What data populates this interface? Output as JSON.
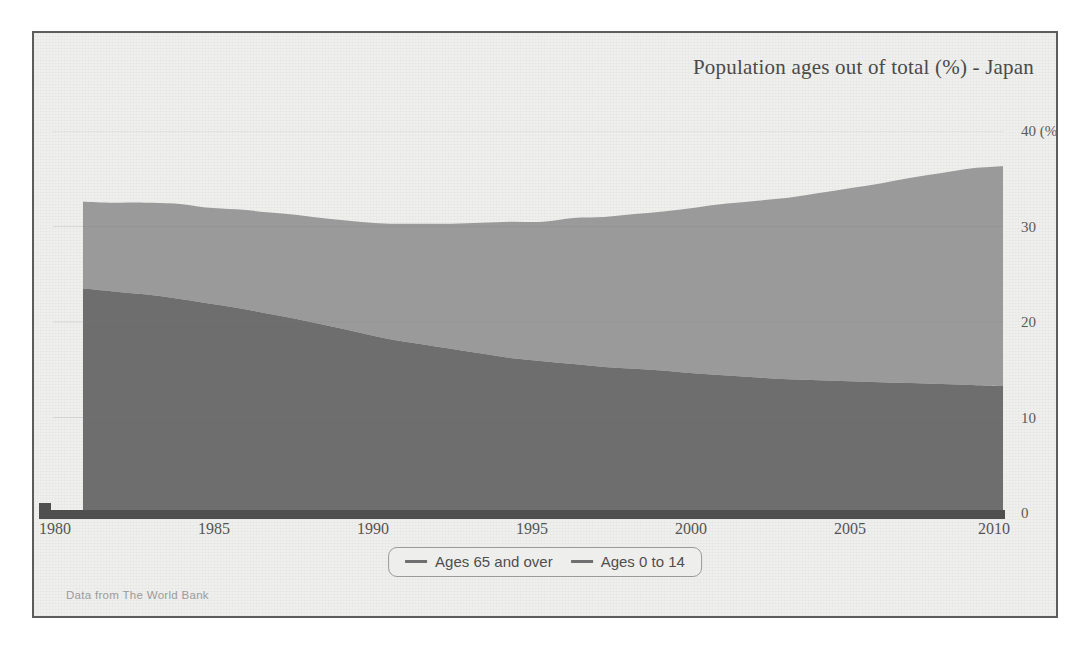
{
  "chart_data": {
    "type": "area",
    "title": "Population ages out of total (%) - Japan",
    "subtitle": "",
    "xlabel": "",
    "ylabel": "",
    "yunit": "(%)",
    "stacked": true,
    "grid": false,
    "legend_position": "bottom",
    "xlim": [
      1980,
      2010
    ],
    "ylim": [
      0,
      40
    ],
    "xticks": [
      "1980",
      "1985",
      "1990",
      "1995",
      "2000",
      "2005",
      "2010"
    ],
    "xtick_values": [
      1980,
      1985,
      1990,
      1995,
      2000,
      2005,
      2010
    ],
    "yticks": [
      "0",
      "10",
      "20",
      "30",
      "40 (%)"
    ],
    "ytick_values": [
      0,
      10,
      20,
      30,
      40
    ],
    "x": [
      1980,
      1981,
      1982,
      1983,
      1984,
      1985,
      1986,
      1987,
      1988,
      1989,
      1990,
      1991,
      1992,
      1993,
      1994,
      1995,
      1996,
      1997,
      1998,
      1999,
      2000,
      2001,
      2002,
      2003,
      2004,
      2005,
      2006,
      2007,
      2008,
      2009,
      2010
    ],
    "series": [
      {
        "name": "Ages 0 to 14",
        "color": "#6e6e6e",
        "stack_order": 1,
        "values": [
          23.5,
          23.2,
          22.9,
          22.5,
          22.0,
          21.5,
          20.9,
          20.3,
          19.6,
          18.9,
          18.2,
          17.7,
          17.2,
          16.7,
          16.2,
          15.9,
          15.6,
          15.3,
          15.1,
          14.9,
          14.6,
          14.4,
          14.2,
          14.0,
          13.9,
          13.8,
          13.7,
          13.6,
          13.5,
          13.4,
          13.3
        ]
      },
      {
        "name": "Ages 65 and over",
        "color": "#9a9a9a",
        "stack_order": 2,
        "values": [
          9.1,
          9.3,
          9.6,
          9.9,
          10.0,
          10.3,
          10.6,
          10.9,
          11.2,
          11.6,
          12.1,
          12.6,
          13.1,
          13.7,
          14.3,
          14.6,
          15.3,
          15.7,
          16.2,
          16.7,
          17.4,
          18.0,
          18.5,
          19.0,
          19.6,
          20.2,
          20.8,
          21.5,
          22.1,
          22.7,
          23.0
        ]
      }
    ],
    "totals": [
      32.6,
      32.5,
      32.5,
      32.4,
      32.0,
      31.8,
      31.5,
      31.2,
      30.8,
      30.5,
      30.3,
      30.3,
      30.3,
      30.4,
      30.5,
      30.5,
      30.9,
      31.0,
      31.3,
      31.6,
      32.0,
      32.4,
      32.7,
      33.0,
      33.5,
      34.0,
      34.5,
      35.1,
      35.6,
      36.1,
      36.3
    ]
  },
  "chart": {
    "title": "Population ages out of total (%) - Japan",
    "y_axis": {
      "ticks": [
        {
          "label": "40 (%)",
          "value": 40
        },
        {
          "label": "30",
          "value": 30
        },
        {
          "label": "20",
          "value": 20
        },
        {
          "label": "10",
          "value": 10
        },
        {
          "label": "0",
          "value": 0
        }
      ]
    },
    "x_axis": {
      "ticks": [
        {
          "label": "1980",
          "value": 1980
        },
        {
          "label": "1985",
          "value": 1985
        },
        {
          "label": "1990",
          "value": 1990
        },
        {
          "label": "1995",
          "value": 1995
        },
        {
          "label": "2000",
          "value": 2000
        },
        {
          "label": "2005",
          "value": 2005
        },
        {
          "label": "2010",
          "value": 2010
        }
      ]
    },
    "legend": {
      "items": [
        {
          "label": "Ages 65 and over",
          "color": "#6f6f6f"
        },
        {
          "label": "Ages 0 to 14",
          "color": "#6f6f6f"
        }
      ]
    },
    "source_note": "Data from The World Bank"
  },
  "colors": {
    "frame_border": "#5d5d5d",
    "paper_background": "#efefee",
    "band_young": "#6e6e6e",
    "band_old": "#9a9a9a",
    "axis_bar": "#4f4f4f",
    "text": "#4a4a4a",
    "source_text": "#9b9b9b"
  }
}
